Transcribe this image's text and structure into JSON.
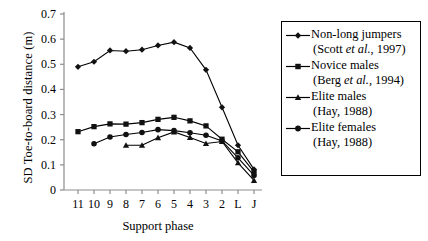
{
  "chart_data": {
    "type": "line",
    "title": "",
    "xlabel": "Support phase",
    "ylabel": "SD Toe-to-board distance (m)",
    "categories": [
      "11",
      "10",
      "9",
      "8",
      "7",
      "6",
      "5",
      "4",
      "3",
      "2",
      "L",
      "J"
    ],
    "ytick_labels": [
      "0",
      "0.1",
      "0.2",
      "0.3",
      "0.4",
      "0.5",
      "0.6",
      "0.7"
    ],
    "ytick_values": [
      0,
      0.1,
      0.2,
      0.3,
      0.4,
      0.5,
      0.6,
      0.7
    ],
    "ylim": [
      0,
      0.7
    ],
    "grid": false,
    "legend_position": "right",
    "series": [
      {
        "name": "Non-long jumpers",
        "source": "(Scott et al., 1997)",
        "marker": "diamond",
        "color": "#000000",
        "values": [
          0.49,
          0.51,
          0.555,
          0.552,
          0.558,
          0.575,
          0.588,
          0.565,
          0.478,
          0.329,
          0.178,
          0.082
        ]
      },
      {
        "name": "Novice males",
        "source": "(Berg et al., 1994)",
        "marker": "square",
        "color": "#000000",
        "values": [
          0.232,
          0.252,
          0.263,
          0.262,
          0.268,
          0.281,
          0.289,
          0.275,
          0.255,
          0.202,
          0.152,
          0.072
        ]
      },
      {
        "name": "Elite males",
        "source": "(Hay, 1988)",
        "marker": "triangle",
        "color": "#000000",
        "values": [
          null,
          null,
          null,
          0.178,
          0.178,
          0.208,
          0.231,
          0.209,
          0.185,
          0.193,
          0.108,
          0.038
        ]
      },
      {
        "name": "Elite females",
        "source": "(Hay, 1988)",
        "marker": "circle",
        "color": "#000000",
        "values": [
          null,
          0.184,
          0.211,
          0.221,
          0.229,
          0.24,
          0.236,
          0.228,
          0.218,
          0.195,
          0.128,
          0.058
        ]
      }
    ]
  },
  "legend": {
    "items": [
      {
        "label": "Non-long jumpers",
        "sub_pre": "(Scott ",
        "sub_it": "et al.",
        "sub_post": ", 1997)",
        "marker": "diamond"
      },
      {
        "label": "Novice males",
        "sub_pre": "(Berg ",
        "sub_it": "et al.",
        "sub_post": ", 1994)",
        "marker": "square"
      },
      {
        "label": "Elite males",
        "sub_pre": "(Hay, 1988)",
        "sub_it": "",
        "sub_post": "",
        "marker": "triangle"
      },
      {
        "label": "Elite females",
        "sub_pre": "(Hay, 1988)",
        "sub_it": "",
        "sub_post": "",
        "marker": "circle"
      }
    ]
  }
}
